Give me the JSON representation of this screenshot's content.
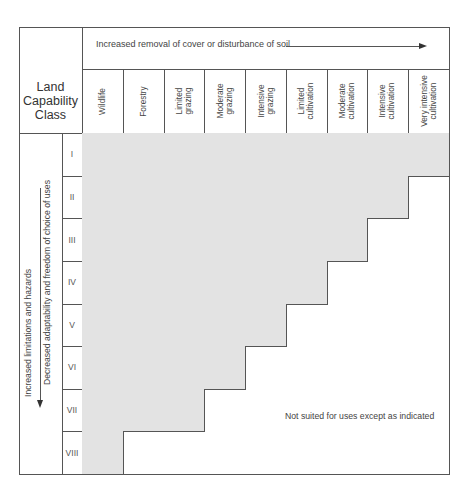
{
  "diagram": {
    "title": "Land Capability Class",
    "title_lines": [
      "Land",
      "Capability",
      "Class"
    ],
    "top_caption": "Increased removal of cover or disturbance of soil",
    "side_caption_outer": "Increased limitations and hazards",
    "side_caption_inner": "Decreased adaptability and freedom of choice of uses",
    "note": "Not suited for uses except as indicated",
    "columns": [
      "Wildlife",
      "Forestry",
      "Limited\ngrazing",
      "Moderate\ngrazing",
      "Intensive\ngrazing",
      "Limited\ncultivation",
      "Moderate\ncultivation",
      "Intensive\ncultivation",
      "Very intensive\ncultivation"
    ],
    "classes": [
      {
        "label": "I",
        "suited_columns": 9
      },
      {
        "label": "II",
        "suited_columns": 8
      },
      {
        "label": "III",
        "suited_columns": 7
      },
      {
        "label": "IV",
        "suited_columns": 6
      },
      {
        "label": "V",
        "suited_columns": 5
      },
      {
        "label": "VI",
        "suited_columns": 4
      },
      {
        "label": "VII",
        "suited_columns": 3
      },
      {
        "label": "VIII",
        "suited_columns": 1
      }
    ],
    "colors": {
      "suited_fill": "#e3e3e3",
      "line": "#555555",
      "text": "#444444"
    }
  }
}
